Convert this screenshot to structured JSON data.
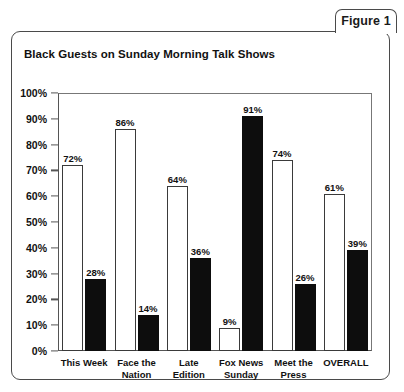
{
  "figure": {
    "tab_label": "Figure 1"
  },
  "chart_data": {
    "type": "bar",
    "title": "Black Guests on Sunday Morning Talk Shows",
    "xlabel": "",
    "ylabel": "",
    "ylim": [
      0,
      100
    ],
    "grid": false,
    "legend": null,
    "categories": [
      "This Week",
      "Face the\nNation",
      "Late\nEdition",
      "Fox News\nSunday",
      "Meet the\nPress",
      "OVERALL"
    ],
    "ytick_labels": [
      "100%",
      "90%",
      "80%",
      "70%",
      "60%",
      "50%",
      "40%",
      "30%",
      "20%",
      "10%",
      "0%"
    ],
    "ytick_values": [
      100,
      90,
      80,
      70,
      60,
      50,
      40,
      30,
      20,
      10,
      0
    ],
    "series": [
      {
        "name": "white-bar",
        "color": "#ffffff",
        "values": [
          72,
          86,
          64,
          9,
          74,
          61
        ],
        "labels": [
          "72%",
          "86%",
          "64%",
          "9%",
          "74%",
          "61%"
        ]
      },
      {
        "name": "black-bar",
        "color": "#0d0d0d",
        "values": [
          28,
          14,
          36,
          91,
          26,
          39
        ],
        "labels": [
          "28%",
          "14%",
          "36%",
          "91%",
          "26%",
          "39%"
        ]
      }
    ]
  }
}
